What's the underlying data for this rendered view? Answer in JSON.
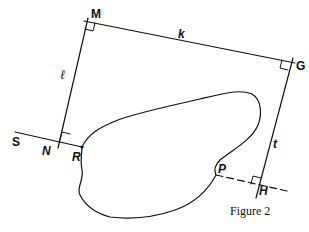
{
  "diagram": {
    "caption": "Figure 2",
    "labels": {
      "M": "M",
      "G": "G",
      "k": "k",
      "ell": "ℓ",
      "S": "S",
      "N": "N",
      "R": "R",
      "P": "P",
      "H": "H",
      "t": "t"
    },
    "colors": {
      "stroke": "#111111",
      "background": "#ffffff"
    }
  }
}
